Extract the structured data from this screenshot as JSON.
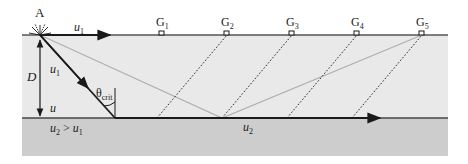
{
  "diagram": {
    "type": "seismic-refraction",
    "colors": {
      "upper_layer": "#e9e9e9",
      "lower_layer": "#cdcdcd",
      "ray": "#1a1a1a",
      "reflected_ray": "#b0b0b0",
      "head_wave": "#2a2a2a"
    },
    "source": {
      "label": "A"
    },
    "labels": {
      "surface_velocity": "u",
      "surface_velocity_sub": "1",
      "ray_velocity": "u",
      "ray_velocity_sub": "1",
      "depth": "D",
      "layer_velocity": "u",
      "angle": "θ",
      "angle_sub": "crit",
      "relation_u2": "u",
      "relation_u2_sub": "2",
      "relation_op": " > ",
      "relation_u1": "u",
      "relation_u1_sub": "1",
      "refracted_velocity": "u",
      "refracted_velocity_sub": "2"
    },
    "geophones": [
      {
        "label": "G",
        "sub": "1"
      },
      {
        "label": "G",
        "sub": "2"
      },
      {
        "label": "G",
        "sub": "3"
      },
      {
        "label": "G",
        "sub": "4"
      },
      {
        "label": "G",
        "sub": "5"
      }
    ]
  }
}
